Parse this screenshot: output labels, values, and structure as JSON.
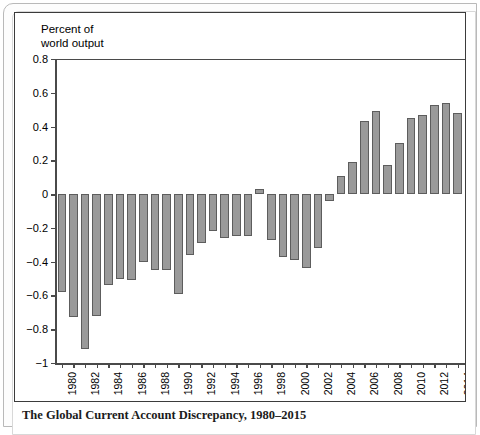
{
  "caption": "The Global Current Account Discrepancy, 1980–2015",
  "colors": {
    "bar_fill": "#9a9a9a",
    "bar_stroke": "#5d5d5d",
    "axis": "#4a4a4a",
    "panel_border": "#3b3b3b",
    "background": "#ffffff"
  },
  "chart_data": {
    "type": "bar",
    "title": "",
    "axis_title": "Percent of\nworld output",
    "xlabel": "",
    "ylabel": "Percent of world output",
    "ylim": [
      -1,
      0.8
    ],
    "ytick_values": [
      0.8,
      0.6,
      0.4,
      0.2,
      0,
      -0.2,
      -0.4,
      -0.6,
      -0.8,
      -1
    ],
    "ytick_labels": [
      "0.8",
      "0.6",
      "0.4",
      "0.2",
      "0",
      "−0.2",
      "−0.4",
      "−0.6",
      "−0.8",
      "−1"
    ],
    "xtick_labels": [
      "1980",
      "1982",
      "1984",
      "1986",
      "1988",
      "1990",
      "1992",
      "1994",
      "1996",
      "1998",
      "2000",
      "2002",
      "2004",
      "2006",
      "2008",
      "2010",
      "2012",
      "2014"
    ],
    "grid": false,
    "legend": "none",
    "categories": [
      "1980",
      "1981",
      "1982",
      "1983",
      "1984",
      "1985",
      "1986",
      "1987",
      "1988",
      "1989",
      "1990",
      "1991",
      "1992",
      "1993",
      "1994",
      "1995",
      "1996",
      "1997",
      "1998",
      "1999",
      "2000",
      "2001",
      "2002",
      "2003",
      "2004",
      "2005",
      "2006",
      "2007",
      "2008",
      "2009",
      "2010",
      "2011",
      "2012",
      "2013",
      "2014",
      "2015"
    ],
    "values": [
      -0.58,
      -0.73,
      -0.92,
      -0.72,
      -0.54,
      -0.5,
      -0.51,
      -0.4,
      -0.45,
      -0.45,
      -0.59,
      -0.36,
      -0.29,
      -0.22,
      -0.26,
      -0.25,
      -0.25,
      0.03,
      -0.27,
      -0.37,
      -0.39,
      -0.44,
      -0.32,
      -0.04,
      0.11,
      0.19,
      0.43,
      0.49,
      0.17,
      0.3,
      0.45,
      0.47,
      0.53,
      0.54,
      0.48,
      0.32
    ]
  }
}
